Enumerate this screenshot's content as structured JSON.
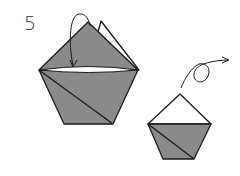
{
  "diagram": {
    "step_number": "5",
    "colors": {
      "paper_colored": "#8a8a8a",
      "paper_white": "#ffffff",
      "line": "#1a1a1a",
      "background": "#ffffff"
    },
    "figures": [
      {
        "id": "before",
        "description": "Pentagon base with colored top flap and white back flap; arrow indicates folding top flap down behind"
      },
      {
        "id": "after",
        "description": "Resulting smaller shape with white top triangle; turn-over arrow indicates flipping model"
      }
    ],
    "arrows": [
      {
        "type": "fold-down-arrow",
        "figure": "before"
      },
      {
        "type": "turn-over-arrow",
        "figure": "after"
      }
    ]
  }
}
